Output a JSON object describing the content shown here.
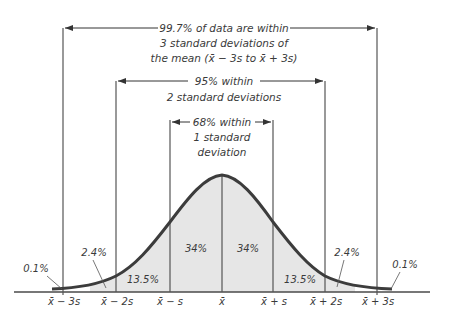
{
  "diagram": {
    "type": "normal-distribution-empirical-rule",
    "colors": {
      "curve": "#3c3c3c",
      "fill": "#e6e6e6",
      "lines": "#4a4a4a",
      "text": "#3a3a3a",
      "background": "#ffffff"
    },
    "brackets": [
      {
        "id": "three_sd",
        "lines": [
          "99.7% of data are within",
          "3 standard deviations of",
          "the mean (x̄ − 3s to x̄ + 3s)"
        ]
      },
      {
        "id": "two_sd",
        "lines": [
          "95% within",
          "2 standard deviations"
        ]
      },
      {
        "id": "one_sd",
        "lines": [
          "68% within",
          "1 standard",
          "deviation"
        ]
      }
    ],
    "regions": [
      {
        "label": "0.1%",
        "range": "below x̄ − 3s"
      },
      {
        "label": "2.4%",
        "range": "x̄ − 3s to x̄ − 2s"
      },
      {
        "label": "13.5%",
        "range": "x̄ − 2s to x̄ − s"
      },
      {
        "label": "34%",
        "range": "x̄ − s to x̄"
      },
      {
        "label": "34%",
        "range": "x̄ to x̄ + s"
      },
      {
        "label": "13.5%",
        "range": "x̄ + s to x̄ + 2s"
      },
      {
        "label": "2.4%",
        "range": "x̄ + 2s to x̄ + 3s"
      },
      {
        "label": "0.1%",
        "range": "above x̄ + 3s"
      }
    ],
    "axis_labels": [
      "x̄ − 3s",
      "x̄ − 2s",
      "x̄ − s",
      "x̄",
      "x̄ + s",
      "x̄ + 2s",
      "x̄ + 3s"
    ]
  }
}
